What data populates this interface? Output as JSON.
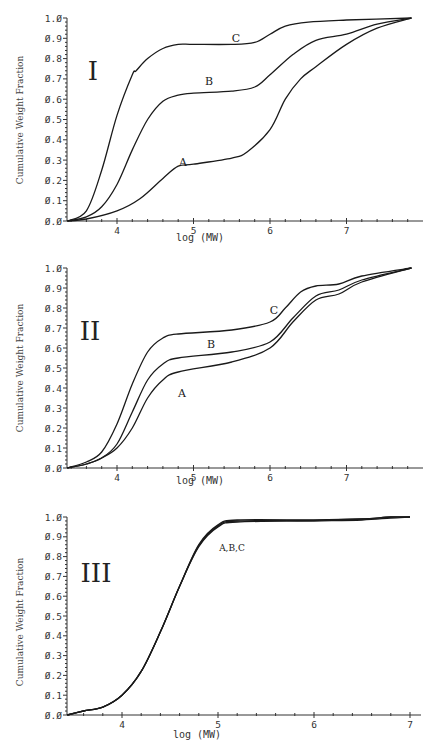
{
  "chart_data": [
    {
      "type": "line",
      "panel": "I",
      "title": "I",
      "xlabel": "log (MW)",
      "ylabel": "Cumulative Weight Fraction",
      "xlim": [
        3.35,
        7.9
      ],
      "ylim": [
        0.0,
        1.0
      ],
      "xticks": [
        "4",
        "5",
        "6",
        "7"
      ],
      "yticks": [
        "0.0",
        "0.1",
        "0.2",
        "0.3",
        "0.4",
        "0.5",
        "0.6",
        "0.7",
        "0.8",
        "0.9",
        "1.0"
      ],
      "grid": false,
      "legend": "inline curve labels",
      "series": [
        {
          "name": "A",
          "x": [
            3.35,
            3.6,
            4.0,
            4.3,
            4.6,
            4.8,
            5.0,
            5.5,
            5.7,
            6.0,
            6.2,
            6.4,
            6.6,
            7.0,
            7.4,
            7.85
          ],
          "values": [
            0.0,
            0.01,
            0.05,
            0.11,
            0.21,
            0.27,
            0.28,
            0.31,
            0.34,
            0.45,
            0.6,
            0.7,
            0.76,
            0.87,
            0.95,
            1.0
          ]
        },
        {
          "name": "B",
          "x": [
            3.35,
            3.6,
            3.8,
            4.0,
            4.2,
            4.4,
            4.6,
            4.8,
            5.0,
            5.5,
            5.8,
            6.0,
            6.3,
            6.6,
            7.0,
            7.4,
            7.85
          ],
          "values": [
            0.0,
            0.02,
            0.07,
            0.18,
            0.35,
            0.5,
            0.59,
            0.62,
            0.63,
            0.64,
            0.66,
            0.72,
            0.82,
            0.89,
            0.92,
            0.97,
            1.0
          ]
        },
        {
          "name": "C",
          "x": [
            3.35,
            3.6,
            3.8,
            4.0,
            4.2,
            4.25,
            4.4,
            4.6,
            4.8,
            5.0,
            5.5,
            5.8,
            6.0,
            6.2,
            6.5,
            7.0,
            7.85
          ],
          "values": [
            0.0,
            0.05,
            0.25,
            0.52,
            0.72,
            0.74,
            0.8,
            0.85,
            0.87,
            0.87,
            0.87,
            0.88,
            0.92,
            0.96,
            0.98,
            0.99,
            1.0
          ]
        }
      ]
    },
    {
      "type": "line",
      "panel": "II",
      "title": "II",
      "xlabel": "log (MW)",
      "ylabel": "Cumulative Weight Fraction",
      "xlim": [
        3.35,
        7.9
      ],
      "ylim": [
        0.0,
        1.0
      ],
      "xticks": [
        "4",
        "5",
        "6",
        "7"
      ],
      "yticks": [
        "0.0",
        "0.1",
        "0.2",
        "0.3",
        "0.4",
        "0.5",
        "0.6",
        "0.7",
        "0.8",
        "0.9",
        "1.0"
      ],
      "grid": false,
      "legend": "inline curve labels",
      "series": [
        {
          "name": "A",
          "x": [
            3.35,
            3.6,
            3.8,
            4.0,
            4.2,
            4.4,
            4.6,
            4.8,
            5.5,
            6.0,
            6.3,
            6.6,
            6.9,
            7.2,
            7.85
          ],
          "values": [
            0.0,
            0.02,
            0.05,
            0.1,
            0.2,
            0.35,
            0.44,
            0.48,
            0.53,
            0.6,
            0.73,
            0.84,
            0.87,
            0.93,
            1.0
          ]
        },
        {
          "name": "B",
          "x": [
            3.35,
            3.6,
            3.8,
            4.0,
            4.2,
            4.4,
            4.6,
            4.8,
            5.5,
            6.0,
            6.3,
            6.6,
            6.9,
            7.2,
            7.85
          ],
          "values": [
            0.0,
            0.02,
            0.05,
            0.12,
            0.28,
            0.44,
            0.52,
            0.55,
            0.58,
            0.63,
            0.75,
            0.86,
            0.89,
            0.94,
            1.0
          ]
        },
        {
          "name": "C",
          "x": [
            3.35,
            3.6,
            3.8,
            4.0,
            4.2,
            4.4,
            4.6,
            4.8,
            5.5,
            6.0,
            6.2,
            6.4,
            6.6,
            6.9,
            7.2,
            7.85
          ],
          "values": [
            0.0,
            0.03,
            0.08,
            0.22,
            0.42,
            0.58,
            0.65,
            0.67,
            0.69,
            0.73,
            0.8,
            0.88,
            0.91,
            0.92,
            0.96,
            1.0
          ]
        }
      ]
    },
    {
      "type": "line",
      "panel": "III",
      "title": "III",
      "xlabel": "log (MW)",
      "ylabel": "Cumulative Weight Fraction",
      "xlim": [
        3.43,
        7.1
      ],
      "ylim": [
        0.0,
        1.0
      ],
      "xticks": [
        "4",
        "5",
        "6",
        "7"
      ],
      "yticks": [
        "0.0",
        "0.1",
        "0.2",
        "0.3",
        "0.4",
        "0.5",
        "0.6",
        "0.7",
        "0.8",
        "0.9",
        "1.0"
      ],
      "grid": false,
      "legend": "inline curve labels",
      "annotation": "A, B, C",
      "series": [
        {
          "name": "A",
          "x": [
            3.43,
            3.6,
            3.8,
            4.0,
            4.2,
            4.4,
            4.6,
            4.8,
            5.0,
            5.2,
            6.0,
            6.5,
            6.8,
            7.0
          ],
          "values": [
            0.0,
            0.02,
            0.04,
            0.1,
            0.22,
            0.42,
            0.65,
            0.85,
            0.95,
            0.975,
            0.98,
            0.985,
            0.995,
            1.0
          ]
        },
        {
          "name": "B",
          "x": [
            3.43,
            3.6,
            3.8,
            4.0,
            4.2,
            4.4,
            4.6,
            4.8,
            5.0,
            5.2,
            6.0,
            6.5,
            6.8,
            7.0
          ],
          "values": [
            0.0,
            0.02,
            0.04,
            0.1,
            0.22,
            0.42,
            0.65,
            0.855,
            0.955,
            0.98,
            0.983,
            0.99,
            1.0,
            1.0
          ]
        },
        {
          "name": "C",
          "x": [
            3.43,
            3.6,
            3.8,
            4.0,
            4.2,
            4.4,
            4.6,
            4.8,
            5.0,
            5.2,
            6.0,
            6.5,
            6.8,
            7.0
          ],
          "values": [
            0.0,
            0.02,
            0.04,
            0.1,
            0.22,
            0.42,
            0.65,
            0.86,
            0.96,
            0.985,
            0.985,
            0.99,
            1.0,
            1.0
          ]
        }
      ]
    }
  ],
  "panels": [
    {
      "label": "I",
      "ylabel": "Cumulative Weight Fraction",
      "xlabel": "log (MW)",
      "curve_labels": {
        "A": "A",
        "B": "B",
        "C": "C"
      }
    },
    {
      "label": "II",
      "ylabel": "Cumulative Weight Fraction",
      "xlabel": "log (MW)",
      "curve_labels": {
        "A": "A",
        "B": "B",
        "C": "C"
      }
    },
    {
      "label": "III",
      "ylabel": "Cumulative Weight Fraction",
      "xlabel": "log (MW)",
      "curve_labels": {
        "ABC": "A,B,C"
      }
    }
  ],
  "ytick_labels": [
    "0.0",
    "0.1",
    "0.2",
    "0.3",
    "0.4",
    "0.5",
    "0.6",
    "0.7",
    "0.8",
    "0.9",
    "1.0"
  ],
  "xtick_labels": [
    "4",
    "5",
    "6",
    "7"
  ],
  "colors": {
    "line": "#1a1a1a",
    "axis": "#333333",
    "background": "#ffffff"
  }
}
